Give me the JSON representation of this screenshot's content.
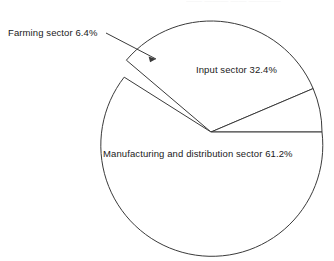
{
  "chart_data": {
    "type": "pie",
    "title": "",
    "categories": [
      "Farming sector",
      "Input sector",
      "Manufacturing and distribution sector"
    ],
    "values": [
      6.4,
      32.4,
      61.2
    ],
    "unit": "%",
    "labels": [
      "Farming sector 6.4%",
      "Input sector 32.4%",
      "Manufacturing and distribution sector 61.2%"
    ],
    "legend": "none",
    "grid": false,
    "geometry": {
      "center_x": 211,
      "center_y": 132,
      "radius": 111,
      "start_angle_deg": 0,
      "direction": "clockwise"
    },
    "slice_colors": [
      "#ffffff",
      "#ffffff",
      "#ffffff"
    ],
    "outline_color": "#3a3a3a"
  },
  "labels": {
    "farming": "Farming sector 6.4%",
    "input": "Input sector 32.4%",
    "manufacturing": "Manufacturing and distribution sector 61.2%"
  },
  "header": {
    "clipped_text": "—— ——— —— ————"
  }
}
